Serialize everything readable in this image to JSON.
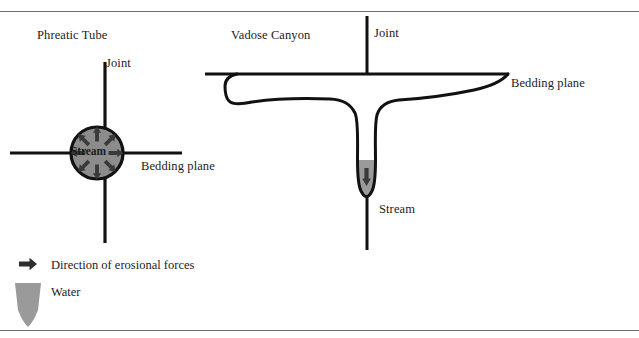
{
  "figure": {
    "title_left": "Phreatic Tube",
    "title_right": "Vadose Canyon"
  },
  "labels": {
    "joint_left": "Joint",
    "joint_right": "Joint",
    "bedding_plane_left": "Bedding plane",
    "bedding_plane_right": "Bedding plane",
    "stream_circle": "Stream",
    "stream_canyon": "Stream"
  },
  "legend": {
    "items": [
      {
        "icon": "right-arrow-icon",
        "label": "Direction of erosional forces"
      },
      {
        "icon": "water-shape-icon",
        "label": "Water"
      }
    ]
  },
  "colors": {
    "line": "#111111",
    "tube_fill": "#8c8c8c",
    "tube_stroke": "#111111",
    "arrow_dark": "#3a3a3a",
    "water_fill": "#9a9a9a",
    "frame_rule": "#6f6f6f",
    "text": "#1c1c1c",
    "background": "#ffffff"
  },
  "diagram": {
    "phreatic_tube": {
      "center_x": 97,
      "center_y": 153,
      "radius": 26,
      "arrow_count": 8,
      "arrow_direction": "inward"
    },
    "vadose_canyon": {
      "stream_arrow_direction": "downward",
      "water_present": true
    }
  }
}
